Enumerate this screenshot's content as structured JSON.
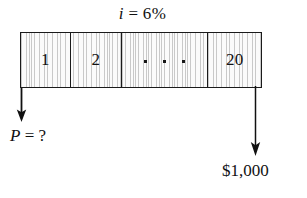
{
  "figure": {
    "interest_rate_label": "i = 6%",
    "interest_rate_symbol": "i",
    "interest_rate_value": "= 6%"
  },
  "timeline": {
    "cells": [
      {
        "label": "1",
        "name": "period-cell-1"
      },
      {
        "label": "2",
        "name": "period-cell-2"
      },
      {
        "label": "· · ·",
        "name": "period-cell-ellipsis"
      },
      {
        "label": "20",
        "name": "period-cell-20"
      }
    ]
  },
  "cash_flows": [
    {
      "name": "present-worth",
      "symbol": "P",
      "value": "= ?",
      "label": "P = ?",
      "direction": "down",
      "position": "start"
    },
    {
      "name": "future-amount",
      "label": "$1,000",
      "direction": "down",
      "position": "end"
    }
  ],
  "colors": {
    "ink": "#111111",
    "bar_fill": "#f2f2f2",
    "hatch": "#c9c9c9",
    "background": "#ffffff"
  }
}
